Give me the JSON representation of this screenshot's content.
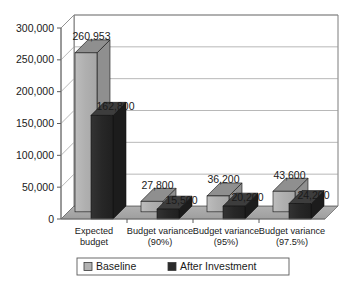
{
  "chart_data": {
    "type": "bar",
    "title": "",
    "subtitle": "",
    "xlabel": "",
    "ylabel": "",
    "categories": [
      "Expected budget",
      "Budget variance (90%)",
      "Budget variance (95%)",
      "Budget variance (97.5%)"
    ],
    "category_lines": [
      [
        "Expected",
        "budget"
      ],
      [
        "Budget variance",
        "(90%)"
      ],
      [
        "Budget variance",
        "(95%)"
      ],
      [
        "Budget variance",
        "(97.5%)"
      ]
    ],
    "series": [
      {
        "name": "Baseline",
        "color": "#b2b2b2",
        "values": [
          260953,
          27800,
          36200,
          43600
        ],
        "labels": [
          "260,953",
          "27,800",
          "36,200",
          "43,600"
        ]
      },
      {
        "name": "After Investment",
        "color": "#2b2b2b",
        "values": [
          162800,
          15500,
          20200,
          24200
        ],
        "labels": [
          "162,800",
          "15,500",
          "20,200",
          "24,200"
        ]
      }
    ],
    "ylim": [
      0,
      300000
    ],
    "yticks": [
      0,
      50000,
      100000,
      150000,
      200000,
      250000,
      300000
    ],
    "ytick_labels": [
      "0",
      "50,000",
      "100,000",
      "150,000",
      "200,000",
      "250,000",
      "300,000"
    ],
    "grid": true,
    "legend_position": "bottom",
    "style": "3d-column",
    "colors": {
      "plot_background": "#ffffff",
      "floor": "#a8a8a8",
      "wall_line": "#6e6e6e",
      "gridline": "#9a9a9a",
      "text": "#1a1a1a",
      "bar_top_light": "#8f8f8f",
      "bar_side_light": "#8f8f8f",
      "bar_top_dark": "#3d3d3d",
      "bar_side_dark": "#1c1c1c"
    }
  },
  "legend": {
    "items": [
      {
        "label": "Baseline",
        "swatch": "#b2b2b2"
      },
      {
        "label": "After Investment",
        "swatch": "#2b2b2b"
      }
    ]
  }
}
